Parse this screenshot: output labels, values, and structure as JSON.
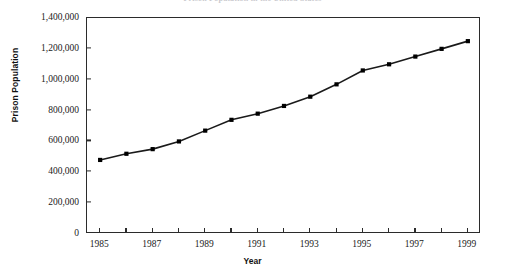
{
  "chart_data": {
    "type": "line",
    "title": "Prison Population in the United States",
    "xlabel": "Year",
    "ylabel": "Prison Population",
    "x": [
      1985,
      1986,
      1987,
      1988,
      1989,
      1990,
      1991,
      1992,
      1993,
      1994,
      1995,
      1996,
      1997,
      1998,
      1999
    ],
    "values": [
      480000,
      520000,
      550000,
      600000,
      670000,
      740000,
      780000,
      830000,
      890000,
      970000,
      1060000,
      1100000,
      1150000,
      1200000,
      1250000
    ],
    "series": [
      {
        "name": "Prison Population",
        "values": [
          480000,
          520000,
          550000,
          600000,
          670000,
          740000,
          780000,
          830000,
          890000,
          970000,
          1060000,
          1100000,
          1150000,
          1200000,
          1250000
        ]
      }
    ],
    "xlim": [
      1984.5,
      1999.5
    ],
    "ylim": [
      0,
      1400000
    ],
    "ytick_labels": [
      "0",
      "200,000",
      "400,000",
      "600,000",
      "800,000",
      "1,000,000",
      "1,200,000",
      "1,400,000"
    ],
    "ytick_values": [
      0,
      200000,
      400000,
      600000,
      800000,
      1000000,
      1200000,
      1400000
    ],
    "xtick_labels": [
      "1985",
      "1987",
      "1989",
      "1991",
      "1993",
      "1995",
      "1997",
      "1999"
    ],
    "xtick_values": [
      1985,
      1987,
      1989,
      1991,
      1993,
      1995,
      1997,
      1999
    ],
    "xtick_minor_values": [
      1986,
      1988,
      1990,
      1992,
      1994,
      1996,
      1998
    ],
    "grid": false,
    "legend": false,
    "marker": "square",
    "line_color": "#1a1a1a",
    "marker_color": "#000000"
  }
}
